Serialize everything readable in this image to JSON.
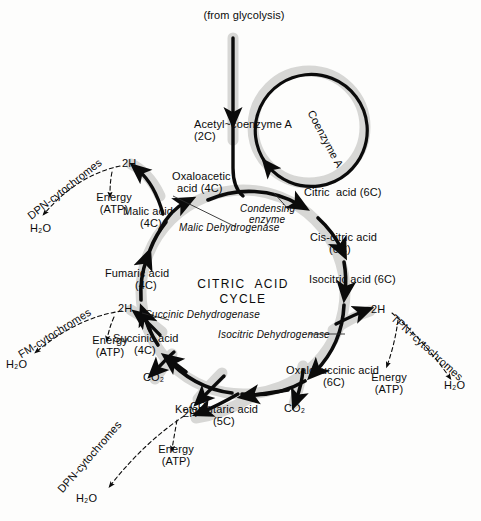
{
  "diagram": {
    "title_line1": "CITRIC  ACID",
    "title_line2": "CYCLE",
    "input_label": "(from glycolysis)",
    "colors": {
      "ink": "#0b0b0b",
      "halo": "#d6d6d4",
      "background": "#fdfdfc"
    }
  },
  "metabolites": [
    {
      "name": "acetyl-coenzyme-a",
      "line1": "Acetyl~coenzyme A",
      "line2": "(2C)"
    },
    {
      "name": "citric-acid",
      "line1": "Citric  acid (6C)",
      "line2": ""
    },
    {
      "name": "cis-citric-acid",
      "line1": "Cis-citric acid",
      "line2": "(6C)"
    },
    {
      "name": "isocitric-acid",
      "line1": "Isocitric acid (6C)",
      "line2": ""
    },
    {
      "name": "oxalosuccinic-acid",
      "line1": "Oxalosuccinic acid",
      "line2": "(6C)"
    },
    {
      "name": "ketoglutaric-acid",
      "line1": "Ketoglutaric acid",
      "line2": "(5C)"
    },
    {
      "name": "succinic-acid",
      "line1": "Succinic acid",
      "line2": "(4C)"
    },
    {
      "name": "fumaric-acid",
      "line1": "Fumaric acid",
      "line2": "(4C)"
    },
    {
      "name": "malic-acid",
      "line1": "Malic acid",
      "line2": "(4C)"
    },
    {
      "name": "oxaloacetic-acid",
      "line1": "Oxaloacetic",
      "line2": "acid (4C)"
    }
  ],
  "labels": {
    "coenzyme_a": "Coenzyme A",
    "hydrogen": "2H",
    "energy_line1": "Energy",
    "energy_line2": "(ATP)",
    "water": "H₂O",
    "carbon_dioxide": "CO₂"
  },
  "enzymes": [
    {
      "name": "condensing-enzyme",
      "line1": "Condensing",
      "line2": "enzyme"
    },
    {
      "name": "malic-dehydrogenase",
      "line1": "Malic Dehydrogenase",
      "line2": ""
    },
    {
      "name": "succinic-dehydrogenase",
      "line1": "Succinic Dehydrogenase",
      "line2": ""
    },
    {
      "name": "isocitric-dehydrogenase",
      "line1": "Isocitric Dehydrogenase",
      "line2": ""
    }
  ],
  "carriers": [
    {
      "name": "carrier-dpn-top-left",
      "text": "DPN-cytochromes"
    },
    {
      "name": "carrier-fm-left",
      "text": "FM-cytochromes"
    },
    {
      "name": "carrier-dpn-bottom-left",
      "text": "DPN-cytochromes"
    },
    {
      "name": "carrier-tpn-right",
      "text": "TPN+cytochromes"
    }
  ],
  "branches": [
    {
      "name": "branch-malic-dehydrogenation",
      "hydrogen": "2H",
      "carrier": "DPN-cytochromes",
      "energy_line1": "Energy",
      "energy_line2": "(ATP)",
      "water": "H₂O"
    },
    {
      "name": "branch-succinic-dehydrogenation",
      "hydrogen": "2H",
      "carrier": "FM-cytochromes",
      "energy_line1": "Energy",
      "energy_line2": "(ATP)",
      "water": "H₂O"
    },
    {
      "name": "branch-ketoglutarate-dehydrogenation",
      "hydrogen": "2H",
      "carrier": "DPN-cytochromes",
      "energy_line1": "Energy",
      "energy_line2": "(ATP)",
      "water": "H₂O"
    },
    {
      "name": "branch-isocitric-dehydrogenation",
      "hydrogen": "2H",
      "carrier": "TPN+cytochromes",
      "energy_line1": "Energy",
      "energy_line2": "(ATP)",
      "water": "H₂O"
    }
  ],
  "co2_releases": [
    {
      "name": "co2-from-oxalosuccinate",
      "text": "CO₂"
    },
    {
      "name": "co2-from-ketoglutarate",
      "text": "CO₂"
    },
    {
      "name": "co2-from-succinate",
      "text": "CO₂"
    }
  ]
}
